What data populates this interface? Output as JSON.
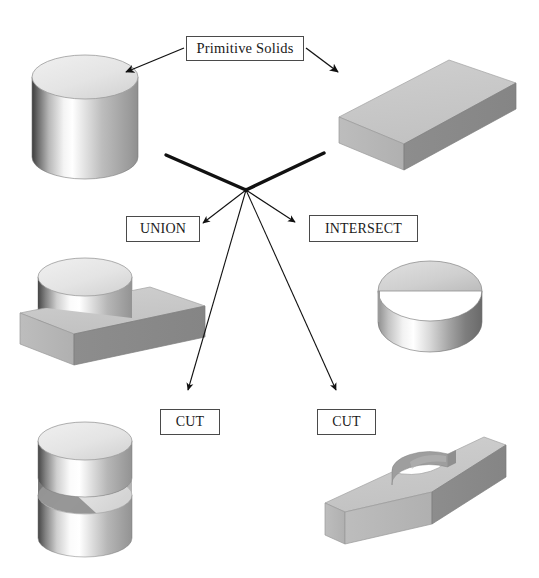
{
  "figure": {
    "kind": "csg-boolean-operations-diagram",
    "background_color": "#ffffff",
    "width": 539,
    "height": 578
  },
  "labels": {
    "primitive_solids": "Primitive Solids",
    "union": "UNION",
    "intersect": "INTERSECT",
    "cut_left": "CUT",
    "cut_right": "CUT"
  },
  "shapes": {
    "cylinder": {
      "name": "cylinder-primitive",
      "description": "Primitive solid: upright cylinder"
    },
    "box": {
      "name": "box-primitive",
      "description": "Primitive solid: rectangular block"
    },
    "union_result": {
      "name": "union-result-solid",
      "description": "Cylinder merged with block"
    },
    "intersect_result": {
      "name": "intersect-result-solid",
      "description": "Half-cylinder overlap volume"
    },
    "cut_left_result": {
      "name": "cut-cylinder-result-solid",
      "description": "Cylinder with slab-shaped slot removed"
    },
    "cut_right_result": {
      "name": "cut-block-result-solid",
      "description": "Block with semicircular notch removed"
    }
  },
  "colors": {
    "outline": "#4a4a4a",
    "text": "#1a1a1a",
    "arrow": "#111111",
    "thick_connector": "#111111",
    "face_top_light": "#c9c9c9",
    "face_front": "#b4b4b4",
    "face_side_dark": "#8a8a8a",
    "cylinder_top": "#e6e6e6",
    "cylinder_body_dark": "#3c3c3c",
    "cylinder_body_highlight": "#ffffff",
    "cylinder_body_mid": "#a6a6a6"
  },
  "connectors": {
    "hub_label": "operation-hub",
    "thick_inputs": [
      "cylinder-to-hub",
      "box-to-hub"
    ],
    "arrows": [
      "primitive-solids-to-cylinder",
      "primitive-solids-to-box",
      "hub-to-union",
      "hub-to-intersect",
      "hub-to-cut-left",
      "hub-to-cut-right"
    ]
  }
}
